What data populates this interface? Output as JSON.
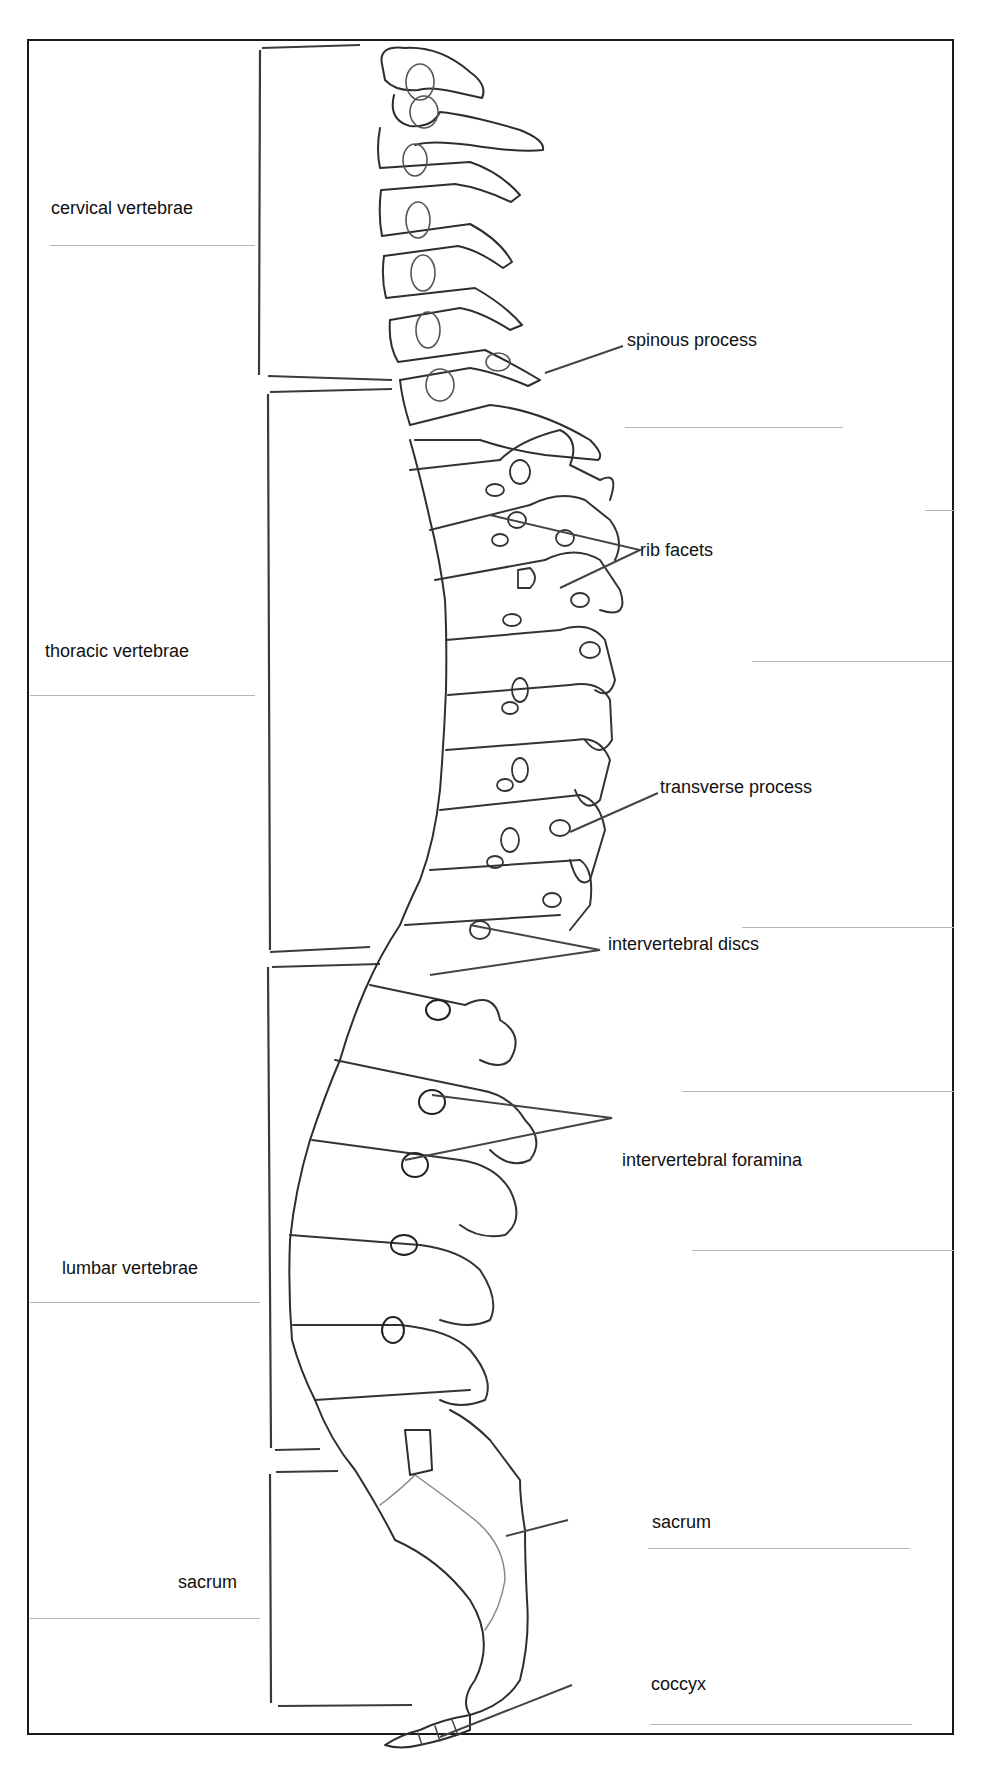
{
  "diagram": {
    "colors": {
      "ink": "#1a1a1a",
      "pencil": "#444444",
      "answer_line": "#b5b5b5",
      "background": "#ffffff"
    },
    "regions": [
      {
        "id": "cervical",
        "label": "cervical vertebrae"
      },
      {
        "id": "thoracic",
        "label": "thoracic vertebrae"
      },
      {
        "id": "lumbar",
        "label": "lumbar vertebrae"
      },
      {
        "id": "sacrum",
        "label": "sacrum"
      }
    ],
    "callouts": [
      {
        "id": "spinous-process",
        "label": "spinous process"
      },
      {
        "id": "rib-facets",
        "label": "rib facets"
      },
      {
        "id": "transverse-process",
        "label": "transverse process"
      },
      {
        "id": "intervertebral-discs",
        "label": "intervertebral discs"
      },
      {
        "id": "intervertebral-foramina",
        "label": "intervertebral foramina"
      },
      {
        "id": "sacrum",
        "label": "sacrum"
      },
      {
        "id": "coccyx",
        "label": "coccyx"
      }
    ]
  }
}
